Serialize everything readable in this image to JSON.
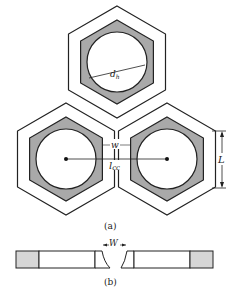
{
  "figure": {
    "part_a": {
      "caption": "(a)",
      "labels": {
        "diameter": "d",
        "diameter_sub": "h",
        "wall": "w",
        "center_distance": "l",
        "center_distance_sub": "cc",
        "side_length": "L"
      },
      "cells": [
        {
          "name": "top-cell",
          "cx": 117,
          "cy": 62
        },
        {
          "name": "left-cell",
          "cx": 66,
          "cy": 159
        },
        {
          "name": "right-cell",
          "cx": 167,
          "cy": 159
        }
      ]
    },
    "part_b": {
      "caption": "(b)",
      "labels": {
        "wall": "W"
      }
    },
    "colors": {
      "stroke": "#222222",
      "fill_gray": "#a9a9a9",
      "fill_light_gray": "#d6d6d6",
      "background": "#ffffff"
    }
  }
}
